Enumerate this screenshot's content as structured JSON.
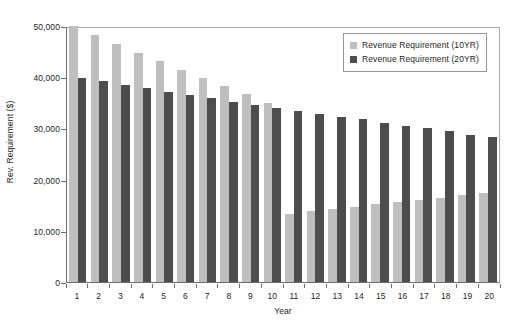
{
  "chart_data": {
    "type": "bar",
    "title": "",
    "xlabel": "Year",
    "ylabel": "Rev. Requirement ($)",
    "categories": [
      "1",
      "2",
      "3",
      "4",
      "5",
      "6",
      "7",
      "8",
      "9",
      "10",
      "11",
      "12",
      "13",
      "14",
      "15",
      "16",
      "17",
      "18",
      "19",
      "20"
    ],
    "ylim": [
      0,
      50000
    ],
    "yticks": [
      0,
      10000,
      20000,
      30000,
      40000,
      50000
    ],
    "ytick_labels": [
      "0",
      "10,000",
      "20,000",
      "30,000",
      "40,000",
      "50,000"
    ],
    "grid": false,
    "legend_position": "top-right",
    "series": [
      {
        "name": "Revenue Requirement (10YR)",
        "color": "#bfbfbf",
        "values": [
          50000,
          48200,
          46400,
          44800,
          43100,
          41500,
          39900,
          38300,
          36700,
          35000,
          13200,
          13800,
          14200,
          14700,
          15200,
          15700,
          16100,
          16500,
          17000,
          17400
        ]
      },
      {
        "name": "Revenue Requirement (20YR)",
        "color": "#4d4d4d",
        "values": [
          39900,
          39300,
          38500,
          37800,
          37200,
          36500,
          35900,
          35200,
          34600,
          34000,
          33400,
          32800,
          32200,
          31900,
          31000,
          30400,
          30000,
          29400,
          28800,
          28300
        ]
      }
    ]
  }
}
